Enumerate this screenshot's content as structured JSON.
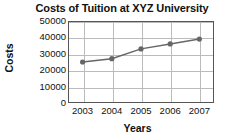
{
  "chart_data": {
    "type": "line",
    "title": "Costs of Tuition at XYZ University",
    "xlabel": "Years",
    "ylabel": "Costs",
    "categories": [
      "2003",
      "2004",
      "2005",
      "2006",
      "2007"
    ],
    "values": [
      25000,
      27000,
      33000,
      36000,
      39000
    ],
    "series": [
      {
        "name": "Costs of Tuition",
        "values": [
          25000,
          27000,
          33000,
          36000,
          39000
        ]
      }
    ],
    "ylim": [
      0,
      50000
    ],
    "yticks": [
      0,
      10000,
      20000,
      30000,
      40000,
      50000
    ],
    "ytick_labels": [
      "0",
      "10000",
      "20000",
      "30000",
      "40000",
      "50000"
    ],
    "xtick_labels": [
      "2003",
      "2004",
      "2005",
      "2006",
      "2007"
    ],
    "grid": true,
    "legend": false,
    "legend_position": "none",
    "line_color": "#666666",
    "marker_color": "#666666",
    "marker": "circle",
    "frame_color": "#555555",
    "grid_color": "#bbbbbb",
    "background": "#ffffff",
    "text_color": "#111111"
  }
}
